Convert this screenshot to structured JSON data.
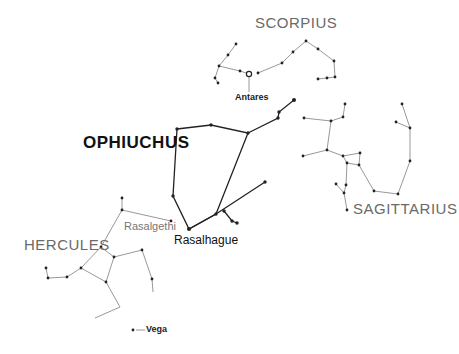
{
  "labels": {
    "scorpius": "SCORPIUS",
    "antares": "Antares",
    "ophiuchus": "OPHIUCHUS",
    "sagittarius": "SAGITTARIUS",
    "hercules": "HERCULES",
    "rasalgethi": "Rasalgethi",
    "rasalhague": "Rasalhague",
    "vega": "Vega"
  },
  "colors": {
    "ophiuchus_line": "#222222",
    "other_line": "#999999",
    "star": "#222222"
  }
}
